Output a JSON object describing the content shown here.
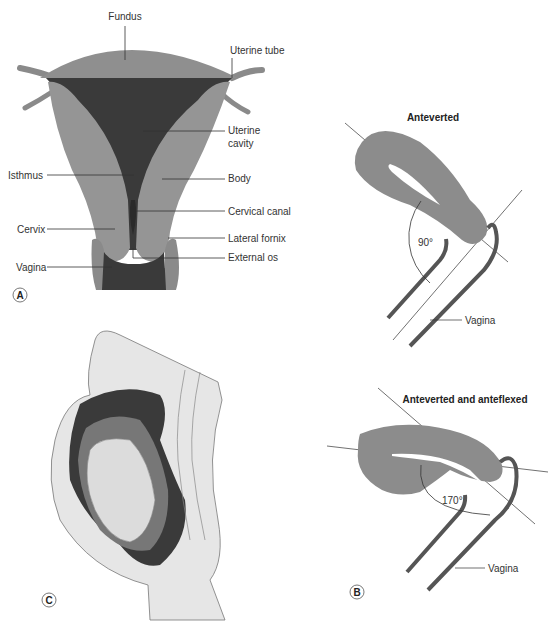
{
  "figure": {
    "panel_a": {
      "letter": "A",
      "labels": {
        "fundus": "Fundus",
        "uterine_tube": "Uterine tube",
        "uterine_cavity_1": "Uterine",
        "uterine_cavity_2": "cavity",
        "isthmus": "Isthmus",
        "body": "Body",
        "cervical_canal": "Cervical canal",
        "cervix": "Cervix",
        "lateral_fornix": "Lateral fornix",
        "vagina": "Vagina",
        "external_os": "External os"
      }
    },
    "panel_b": {
      "letter": "B",
      "top": {
        "title": "Anteverted",
        "angle": "90°",
        "vagina_label": "Vagina"
      },
      "bottom": {
        "title": "Anteverted and anteflexed",
        "angle": "170°",
        "vagina_label": "Vagina"
      }
    },
    "panel_c": {
      "letter": "C"
    }
  },
  "colors": {
    "tissue": "#8f8f8f",
    "tissue_light": "#a3a3a3",
    "cavity": "#3a3a3a",
    "body_fill": "#e6e6e6",
    "outline": "#777777",
    "uterus_b": "#8c8c8c",
    "vagina_wall": "#555555"
  }
}
